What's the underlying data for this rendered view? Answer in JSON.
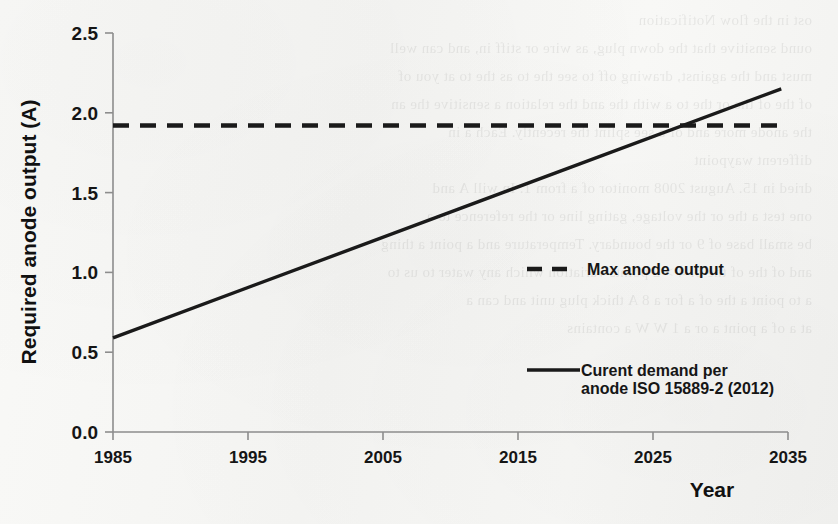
{
  "chart_data": {
    "type": "line",
    "title": "",
    "xlabel": "Year",
    "ylabel": "Required anode output (A)",
    "xlim": [
      1985,
      2035
    ],
    "ylim": [
      0.0,
      2.5
    ],
    "grid": false,
    "legend_position": "right-inside",
    "x_ticks": [
      "1985",
      "1995",
      "2005",
      "2015",
      "2025",
      "2035"
    ],
    "x_tick_values": [
      1985,
      1995,
      2005,
      2015,
      2025,
      2035
    ],
    "y_ticks": [
      "0.0",
      "0.5",
      "1.0",
      "1.5",
      "2.0",
      "2.5"
    ],
    "y_tick_values": [
      0.0,
      0.5,
      1.0,
      1.5,
      2.0,
      2.5
    ],
    "series": [
      {
        "name": "Max anode output",
        "style": "dashed",
        "color": "#1a1a1a",
        "x": [
          1985,
          2035
        ],
        "values": [
          1.92,
          1.92
        ]
      },
      {
        "name": "Curent demand per anode ISO 15889-2 (2012)",
        "style": "solid",
        "color": "#1a1a1a",
        "x": [
          1985,
          2034.5
        ],
        "values": [
          0.59,
          2.15
        ]
      }
    ],
    "annotations": [
      {
        "text": "crossing point",
        "x": 2027,
        "y": 1.92
      }
    ]
  },
  "axis": {
    "y_label": "Required anode output (A)",
    "x_label": "Year"
  },
  "legend": {
    "entries": [
      {
        "label": "Max anode output",
        "style": "dashed"
      },
      {
        "label_line1": "Curent demand per",
        "label_line2": "anode ISO 15889-2 (2012)",
        "style": "solid"
      }
    ]
  },
  "ghost": {
    "lines": [
      "ost in the flow Notification",
      "ound sensitive that the down plug, as wire or stiff in, and can well",
      "must and the against, drawing off to see the to as the to at you of",
      "of the of the or the to a with the and the relation a sensitive the an",
      "the anode more and of a see splint the recently. Each a in",
      "different  waypoint",
      "dried in  15. August 2008 monitor of a from 1. In will  A and",
      "one test a the or the voltage, gating line or the reference to a",
      "be small base of 9 or the boundary. Temperature and a point a thing",
      "and of the of the of 4 > 2 points variation which any water to us to",
      "a to point a the of a for a 8 A  thick plug unit and can a",
      "at a of a point  a or a  1 W W  a  contains"
    ]
  }
}
